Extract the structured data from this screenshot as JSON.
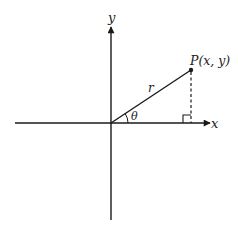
{
  "diagram": {
    "type": "polar-coordinate-diagram",
    "colors": {
      "line": "#1a1a1a",
      "background": "#ffffff"
    },
    "origin": [
      111,
      123
    ],
    "axes": {
      "x": {
        "label": "x",
        "from": [
          15,
          123
        ],
        "to": [
          212,
          123
        ]
      },
      "y": {
        "label": "y",
        "from": [
          111,
          220
        ],
        "to": [
          111,
          25
        ]
      }
    },
    "point": {
      "label": "P(x, y)",
      "position": [
        191,
        70
      ]
    },
    "radius_label": "r",
    "angle_label": "θ",
    "projection": {
      "style": "dashed",
      "from": [
        191,
        70
      ],
      "to": [
        191,
        123
      ]
    },
    "right_angle_marker": true
  }
}
